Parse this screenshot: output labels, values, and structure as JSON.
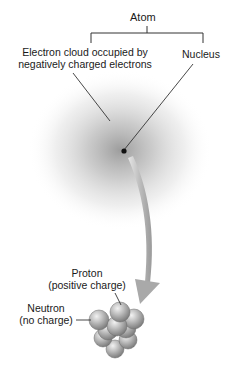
{
  "diagram": {
    "title": "Atom",
    "branches": [
      {
        "label_line1": "Electron cloud occupied by",
        "label_line2": "negatively charged electrons"
      },
      {
        "label_line1": "Nucleus"
      }
    ],
    "nucleus_parts": [
      {
        "label_line1": "Proton",
        "label_line2": "(positive charge)"
      },
      {
        "label_line1": "Neutron",
        "label_line2": "(no charge)"
      }
    ],
    "colors": {
      "line": "#333333",
      "cloud": "#8a8a8a",
      "arrow": "#bdbdbd",
      "particle": "#a8a8a8"
    }
  }
}
